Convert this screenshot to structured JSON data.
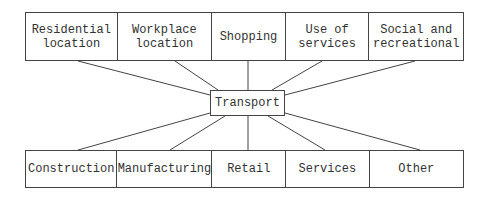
{
  "diagram": {
    "type": "hub-and-spoke",
    "hub": {
      "label": "Transport"
    },
    "top_row": [
      {
        "label": "Residential\nlocation"
      },
      {
        "label": "Workplace\nlocation"
      },
      {
        "label": "Shopping"
      },
      {
        "label": "Use of\nservices"
      },
      {
        "label": "Social and\nrecreational"
      }
    ],
    "bottom_row": [
      {
        "label": "Construction"
      },
      {
        "label": "Manufacturing"
      },
      {
        "label": "Retail"
      },
      {
        "label": "Services"
      },
      {
        "label": "Other"
      }
    ],
    "line_color": "#444444"
  }
}
